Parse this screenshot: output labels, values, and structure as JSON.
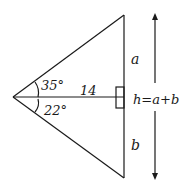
{
  "diagram": {
    "labels": {
      "angle_top": "35°",
      "angle_bottom": "22°",
      "altitude": "14",
      "segment_top": "a",
      "segment_bottom": "b",
      "height": "h=a+b"
    },
    "stroke_color": "#1a1a1a",
    "background": "#ffffff"
  }
}
